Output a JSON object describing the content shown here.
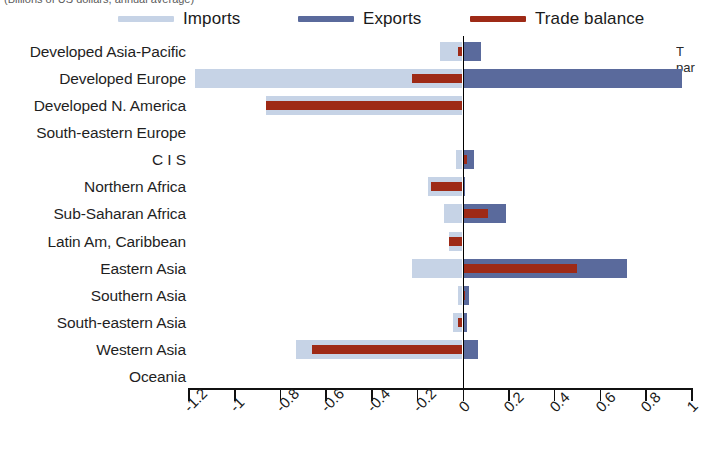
{
  "top_caption": "(Billions of US dollars, annual average)",
  "right_note_line1": "T",
  "right_note_line2": "par",
  "legend": {
    "items": [
      {
        "label": "Imports",
        "color": "#c6d3e6",
        "name": "imports"
      },
      {
        "label": "Exports",
        "color": "#5a6a9c",
        "name": "exports"
      },
      {
        "label": "Trade balance",
        "color": "#9e2a16",
        "name": "trade-balance"
      }
    ]
  },
  "colors": {
    "imports": "#c6d3e6",
    "exports": "#5a6a9c",
    "trade_balance": "#9e2a16",
    "axis": "#111111",
    "zero_line": "#000000"
  },
  "chart_data": {
    "type": "bar",
    "orientation": "horizontal",
    "title": "",
    "xlabel": "",
    "ylabel": "",
    "xlim": [
      -1.2,
      1.0
    ],
    "grid": false,
    "legend_position": "top",
    "xticks": [
      -1.2,
      -1,
      -0.8,
      -0.6,
      -0.4,
      -0.2,
      0,
      0.2,
      0.4,
      0.6,
      0.8,
      1
    ],
    "xticklabels": [
      "-1.2",
      "-1",
      "-0.8",
      "-0.6",
      "-0.4",
      "-0.2",
      "0",
      "0.2",
      "0.4",
      "0.6",
      "0.8",
      "1"
    ],
    "categories": [
      "Developed Asia-Pacific",
      "Developed Europe",
      "Developed N. America",
      "South-eastern Europe",
      "C I S",
      "Northern Africa",
      "Sub-Saharan Africa",
      "Latin Am, Caribbean",
      "Eastern Asia",
      "Southern Asia",
      "South-eastern Asia",
      "Western Asia",
      "Oceania"
    ],
    "series": [
      {
        "name": "Imports",
        "color": "#c6d3e6",
        "values": [
          -0.1,
          -1.17,
          -0.86,
          0.0,
          -0.03,
          -0.15,
          -0.08,
          -0.06,
          -0.22,
          -0.02,
          -0.04,
          -0.73,
          0.0
        ]
      },
      {
        "name": "Exports",
        "color": "#5a6a9c",
        "values": [
          0.08,
          0.96,
          0.0,
          0.0,
          0.05,
          0.01,
          0.19,
          0.0,
          0.72,
          0.03,
          0.02,
          0.07,
          0.0
        ]
      },
      {
        "name": "Trade balance",
        "color": "#9e2a16",
        "values": [
          -0.02,
          -0.22,
          -0.86,
          0.0,
          0.02,
          -0.14,
          0.11,
          -0.06,
          0.5,
          0.01,
          -0.02,
          -0.66,
          0.0
        ]
      }
    ]
  }
}
